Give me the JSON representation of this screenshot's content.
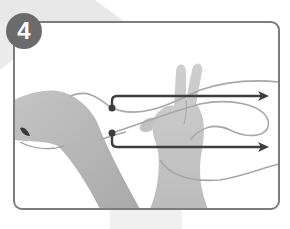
{
  "step": {
    "number": "4",
    "badge_color": "#6b6b6b",
    "badge_text_color": "#ffffff"
  },
  "frame": {
    "stroke_color": "#7c7c7c",
    "background": "#ffffff"
  },
  "illustration": {
    "subject": "left arm with fist and open right hand holding loops of string",
    "arrows": [
      {
        "name": "upper-string-arrow",
        "direction": "right",
        "color": "#3d3d3d"
      },
      {
        "name": "lower-string-arrow",
        "direction": "right",
        "color": "#3d3d3d"
      }
    ],
    "string_color": "#a8a8a8",
    "skin_tone_gray": "#b9b9b9"
  },
  "background": {
    "band_color": "#e6e6e6",
    "strip_color": "#efefef"
  }
}
